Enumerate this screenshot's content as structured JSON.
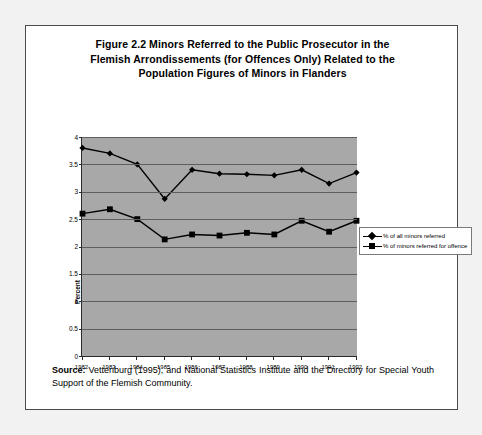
{
  "figure": {
    "title_lines": [
      "Figure 2.2 Minors Referred to the Public Prosecutor in the",
      "Flemish Arrondissements (for Offences Only) Related to the",
      "Population Figures of Minors in Flanders"
    ],
    "source_label": "Source:",
    "source_text": " Vettenburg (1995), and National Statistics Institute and the Directory for Special Youth Support of the Flemish Community."
  },
  "colors": {
    "plot_background": "#a8a8a8",
    "gridline": "#5e5e5e",
    "axis": "#2b2b2b",
    "series": "#000000",
    "page_background": "#f2f2f2",
    "frame_background": "#ffffff"
  },
  "chart_data": {
    "type": "line",
    "title": "Figure 2.2 Minors Referred to the Public Prosecutor in the Flemish Arrondissements (for Offences Only) Related to the Population Figures of Minors in Flanders",
    "xlabel": "",
    "ylabel": "Percent",
    "categories": [
      "1982",
      "1983",
      "1984",
      "1985",
      "1986",
      "1987",
      "1988",
      "1989",
      "1990",
      "1991",
      "1992"
    ],
    "ylim": [
      0,
      4
    ],
    "yticks": [
      "0",
      "0.5",
      "1",
      "1.5",
      "2",
      "2.5",
      "3",
      "3.5",
      "4"
    ],
    "ytick_values": [
      0,
      0.5,
      1,
      1.5,
      2,
      2.5,
      3,
      3.5,
      4
    ],
    "grid": true,
    "legend_position": "right-outside",
    "series": [
      {
        "name": "% of all minors referred",
        "marker": "diamond",
        "values": [
          3.8,
          3.7,
          3.5,
          2.87,
          3.4,
          3.33,
          3.32,
          3.3,
          3.4,
          3.15,
          3.35
        ]
      },
      {
        "name": "% of minors referred for offence",
        "marker": "square",
        "values": [
          2.6,
          2.68,
          2.5,
          2.13,
          2.22,
          2.2,
          2.25,
          2.22,
          2.47,
          2.27,
          2.47
        ]
      }
    ]
  }
}
